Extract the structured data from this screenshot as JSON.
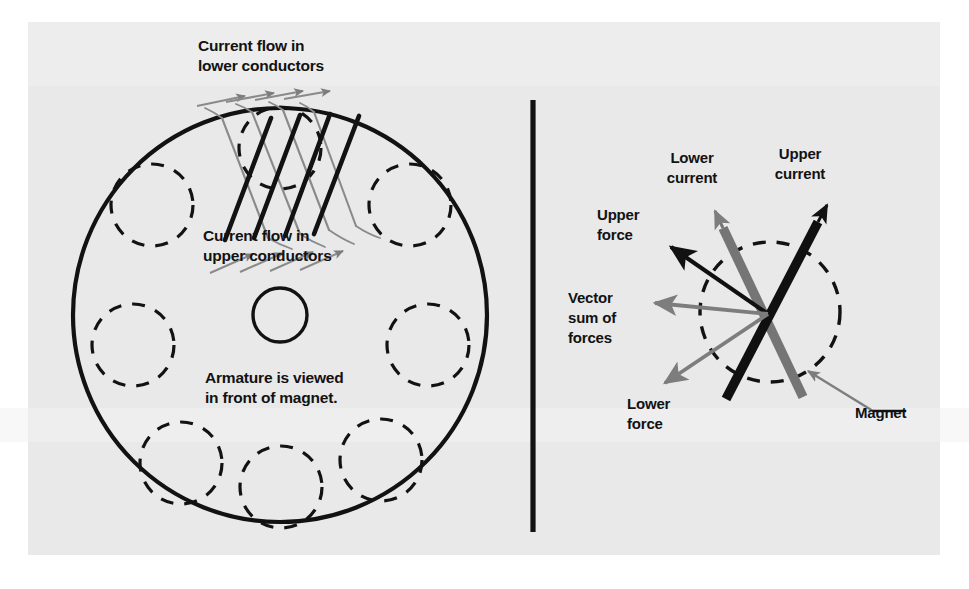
{
  "figure": {
    "background_color": "#ffffff",
    "panel_color": "#e9e9e9",
    "ink_color": "#121212",
    "accent_gray": "#7d7d7d"
  },
  "left_panel": {
    "name": "armature-face-view",
    "labels": {
      "lower_conductors_line1": "Current flow in",
      "lower_conductors_line2": "lower conductors",
      "upper_conductors_line1": "Current flow in",
      "upper_conductors_line2": "upper conductors",
      "viewing_note_line1": "Armature is viewed",
      "viewing_note_line2": "in front of magnet."
    },
    "geometry": {
      "armature_center_x": 280,
      "armature_center_y": 315,
      "armature_radius": 207,
      "hub_radius": 27,
      "pole_count": 7,
      "pole_radius": 40
    }
  },
  "divider": {
    "name": "panel-divider",
    "x": 533,
    "y_top": 100,
    "y_bottom": 532,
    "thickness": 5
  },
  "right_panel": {
    "name": "force-vector-detail",
    "labels": {
      "lower_current_line1": "Lower",
      "lower_current_line2": "current",
      "upper_current_line1": "Upper",
      "upper_current_line2": "current",
      "upper_force_line1": "Upper",
      "upper_force_line2": "force",
      "vector_sum_line1": "Vector",
      "vector_sum_line2": "sum of",
      "vector_sum_line3": "forces",
      "lower_force_line1": "Lower",
      "lower_force_line2": "force",
      "magnet": "Magnet"
    },
    "geometry": {
      "magnet_center_x": 770,
      "magnet_center_y": 312,
      "magnet_radius": 70,
      "crossing_x": 768,
      "crossing_y": 314
    },
    "vectors": [
      {
        "name": "upper-current",
        "color": "#121212",
        "direction_deg": 55,
        "style": "thick-bar-arrow"
      },
      {
        "name": "lower-current",
        "color": "#6e6e6e",
        "direction_deg": 110,
        "style": "thick-bar-arrow"
      },
      {
        "name": "upper-force",
        "color": "#121212",
        "direction_deg": 152,
        "style": "thin-arrow"
      },
      {
        "name": "vector-sum-of-forces",
        "color": "#7d7d7d",
        "direction_deg": 183,
        "style": "thin-arrow"
      },
      {
        "name": "lower-force",
        "color": "#7d7d7d",
        "direction_deg": 213,
        "style": "thin-arrow"
      }
    ]
  }
}
